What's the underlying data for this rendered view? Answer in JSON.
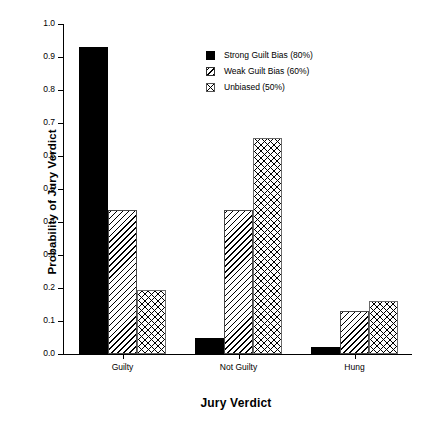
{
  "chart_data": {
    "type": "bar",
    "title": "",
    "xlabel": "Jury Verdict",
    "ylabel": "Probability of Jury Verdict",
    "categories": [
      "Guilty",
      "Not Guilty",
      "Hung"
    ],
    "series": [
      {
        "name": "Strong Guilt Bias (80%)",
        "pattern": "solid",
        "values": [
          0.93,
          0.05,
          0.02
        ]
      },
      {
        "name": "Weak Guilt Bias (60%)",
        "pattern": "hatch",
        "values": [
          0.435,
          0.435,
          0.13
        ]
      },
      {
        "name": "Unbiased (50%)",
        "pattern": "stipple",
        "values": [
          0.195,
          0.655,
          0.16
        ]
      }
    ],
    "ylim": [
      0.0,
      1.0
    ],
    "ytick_labels": [
      "0.0",
      "0.1",
      "0.2",
      "0.3",
      "0.4",
      "0.5",
      "0.6",
      "0.7",
      "0.8",
      "0.9",
      "1.0"
    ],
    "ytick_values": [
      0.0,
      0.1,
      0.2,
      0.3,
      0.4,
      0.5,
      0.6,
      0.7,
      0.8,
      0.9,
      1.0
    ],
    "grid": false,
    "legend_position": "upper center"
  },
  "legend": {
    "entries": [
      {
        "label": "Strong Guilt Bias (80%)"
      },
      {
        "label": "Weak Guilt Bias (60%)"
      },
      {
        "label": "Unbiased (50%)"
      }
    ]
  },
  "colors": {
    "background": "#ffffff",
    "foreground": "#000000",
    "bar_solid": "#000000",
    "bar_outline": "#4a4a4a"
  }
}
